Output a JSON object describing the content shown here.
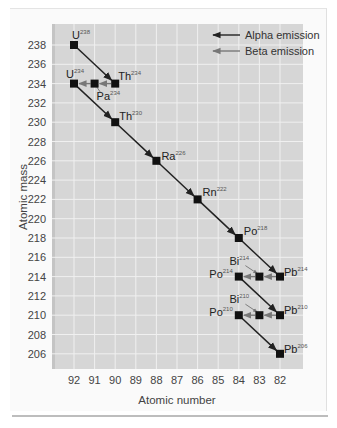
{
  "chart_data": {
    "type": "scatter",
    "title": "",
    "xlabel": "Atomic number",
    "ylabel": "Atomic mass",
    "x_reversed": true,
    "xlim": [
      92,
      82
    ],
    "ylim": [
      204,
      240
    ],
    "x_ticks": [
      92,
      91,
      90,
      89,
      88,
      87,
      86,
      85,
      84,
      83,
      82
    ],
    "y_ticks": [
      238,
      236,
      234,
      232,
      230,
      228,
      226,
      224,
      222,
      220,
      218,
      216,
      214,
      212,
      210,
      208,
      206
    ],
    "grid": true,
    "legend": [
      {
        "label": "Alpha emission",
        "color": "#222222"
      },
      {
        "label": "Beta emission",
        "color": "#777777"
      }
    ],
    "legend_position": "top-right",
    "points": [
      {
        "symbol": "U",
        "mass": 238,
        "z": 92
      },
      {
        "symbol": "Th",
        "mass": 234,
        "z": 90
      },
      {
        "symbol": "Pa",
        "mass": 234,
        "z": 91
      },
      {
        "symbol": "U",
        "mass": 234,
        "z": 92
      },
      {
        "symbol": "Th",
        "mass": 230,
        "z": 90
      },
      {
        "symbol": "Ra",
        "mass": 226,
        "z": 88
      },
      {
        "symbol": "Rn",
        "mass": 222,
        "z": 86
      },
      {
        "symbol": "Po",
        "mass": 218,
        "z": 84
      },
      {
        "symbol": "Pb",
        "mass": 214,
        "z": 82
      },
      {
        "symbol": "Bi",
        "mass": 214,
        "z": 83
      },
      {
        "symbol": "Po",
        "mass": 214,
        "z": 84
      },
      {
        "symbol": "Pb",
        "mass": 210,
        "z": 82
      },
      {
        "symbol": "Bi",
        "mass": 210,
        "z": 83
      },
      {
        "symbol": "Po",
        "mass": 210,
        "z": 84
      },
      {
        "symbol": "Pb",
        "mass": 206,
        "z": 82
      }
    ],
    "transitions": [
      {
        "type": "alpha",
        "from": "U-238",
        "to": "Th-234"
      },
      {
        "type": "beta",
        "from": "Th-234",
        "to": "Pa-234"
      },
      {
        "type": "beta",
        "from": "Pa-234",
        "to": "U-234"
      },
      {
        "type": "alpha",
        "from": "U-234",
        "to": "Th-230"
      },
      {
        "type": "alpha",
        "from": "Th-230",
        "to": "Ra-226"
      },
      {
        "type": "alpha",
        "from": "Ra-226",
        "to": "Rn-222"
      },
      {
        "type": "alpha",
        "from": "Rn-222",
        "to": "Po-218"
      },
      {
        "type": "alpha",
        "from": "Po-218",
        "to": "Pb-214"
      },
      {
        "type": "beta",
        "from": "Pb-214",
        "to": "Bi-214"
      },
      {
        "type": "beta",
        "from": "Bi-214",
        "to": "Po-214"
      },
      {
        "type": "alpha",
        "from": "Po-214",
        "to": "Pb-210"
      },
      {
        "type": "beta",
        "from": "Pb-210",
        "to": "Bi-210"
      },
      {
        "type": "beta",
        "from": "Bi-210",
        "to": "Po-210"
      },
      {
        "type": "alpha",
        "from": "Po-210",
        "to": "Pb-206"
      }
    ]
  },
  "labels": {
    "xlabel": "Atomic number",
    "ylabel": "Atomic mass",
    "legend_alpha": "Alpha emission",
    "legend_beta": "Beta emission"
  },
  "colors": {
    "plot_bg": "#d6d6d6",
    "grid": "#f2f2f2",
    "alpha": "#222222",
    "beta": "#777777",
    "marker": "#111111"
  }
}
